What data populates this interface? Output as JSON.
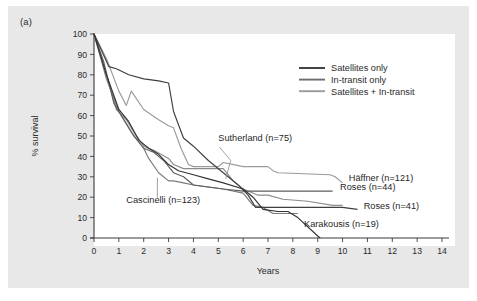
{
  "figure": {
    "panel_label": "(a)",
    "background_color": "#e8e8e8",
    "plot_background_color": "#ffffff"
  },
  "chart_data": {
    "type": "line",
    "title": "",
    "xlabel": "Years",
    "ylabel": "% survival",
    "xlim": [
      0,
      14
    ],
    "ylim": [
      0,
      100
    ],
    "xticks": [
      0,
      1,
      2,
      3,
      4,
      5,
      6,
      7,
      8,
      9,
      10,
      11,
      12,
      13,
      14
    ],
    "yticks": [
      0,
      10,
      20,
      30,
      40,
      50,
      60,
      70,
      80,
      90,
      100
    ],
    "grid": false,
    "legend_position": "upper-right",
    "legend": [
      {
        "label": "Satellites only",
        "color": "#3a3a3a"
      },
      {
        "label": "In-transit only",
        "color": "#6e6e6e"
      },
      {
        "label": "Satellites + In-transit",
        "color": "#9a9a9a"
      }
    ],
    "series": [
      {
        "name": "Haffner (n=121)",
        "group": "Satellites + In-transit",
        "color": "#9a9a9a",
        "points": [
          [
            0,
            100
          ],
          [
            0.5,
            88
          ],
          [
            1.0,
            72
          ],
          [
            1.3,
            65
          ],
          [
            1.5,
            72
          ],
          [
            2.0,
            63
          ],
          [
            2.6,
            58
          ],
          [
            3.0,
            55
          ],
          [
            3.2,
            54
          ],
          [
            3.5,
            44
          ],
          [
            3.8,
            36
          ],
          [
            4.0,
            35
          ],
          [
            5.0,
            35
          ],
          [
            5.2,
            37
          ],
          [
            6.0,
            35
          ],
          [
            7.0,
            35
          ],
          [
            7.2,
            33
          ],
          [
            7.4,
            32
          ],
          [
            9.5,
            31
          ],
          [
            9.7,
            30
          ],
          [
            10.0,
            27
          ]
        ]
      },
      {
        "name": "Sutherland (n=75)",
        "group": "Satellites + In-transit",
        "color": "#8c8c8c",
        "points": [
          [
            0,
            100
          ],
          [
            0.4,
            84
          ],
          [
            0.9,
            63
          ],
          [
            1.3,
            58
          ],
          [
            1.6,
            52
          ],
          [
            2.0,
            45
          ],
          [
            2.4,
            43
          ],
          [
            3.0,
            39
          ],
          [
            3.2,
            36
          ],
          [
            3.6,
            34
          ],
          [
            4.0,
            34
          ],
          [
            4.6,
            34
          ],
          [
            5.2,
            34
          ],
          [
            5.6,
            28
          ],
          [
            6.0,
            24
          ],
          [
            6.6,
            21
          ],
          [
            7.0,
            21
          ],
          [
            7.6,
            19
          ],
          [
            8.6,
            18
          ],
          [
            9.6,
            16
          ],
          [
            10.0,
            16
          ]
        ]
      },
      {
        "name": "Cascinelli (n=123)",
        "group": "In-transit only",
        "color": "#7a7a7a",
        "points": [
          [
            0,
            100
          ],
          [
            0.5,
            78
          ],
          [
            1.0,
            62
          ],
          [
            1.5,
            52
          ],
          [
            2.0,
            44
          ],
          [
            2.2,
            39
          ],
          [
            2.6,
            32
          ],
          [
            3.0,
            28
          ],
          [
            3.2,
            28
          ],
          [
            3.6,
            27
          ],
          [
            4.0,
            26
          ],
          [
            4.6,
            25
          ],
          [
            5.2,
            24
          ],
          [
            6.0,
            22
          ],
          [
            6.4,
            16
          ],
          [
            6.8,
            15
          ],
          [
            7.2,
            12
          ],
          [
            8.0,
            12
          ],
          [
            8.2,
            12
          ]
        ]
      },
      {
        "name": "Roses (n=44)",
        "group": "In-transit only",
        "color": "#5e5e5e",
        "points": [
          [
            0,
            100
          ],
          [
            0.4,
            86
          ],
          [
            0.8,
            66
          ],
          [
            1.2,
            58
          ],
          [
            1.6,
            50
          ],
          [
            2.0,
            44
          ],
          [
            2.4,
            42
          ],
          [
            2.8,
            38
          ],
          [
            3.2,
            32
          ],
          [
            3.6,
            30
          ],
          [
            4.0,
            26
          ],
          [
            4.6,
            25
          ],
          [
            5.2,
            24
          ],
          [
            6.0,
            23
          ],
          [
            6.6,
            23
          ],
          [
            7.4,
            23
          ],
          [
            8.2,
            23
          ],
          [
            9.0,
            23
          ],
          [
            9.6,
            23
          ]
        ]
      },
      {
        "name": "Roses (n=41)",
        "group": "Satellites only",
        "color": "#3f3f3f",
        "points": [
          [
            0,
            100
          ],
          [
            0.6,
            84
          ],
          [
            0.9,
            83
          ],
          [
            1.4,
            80
          ],
          [
            2.0,
            78
          ],
          [
            2.6,
            77
          ],
          [
            3.0,
            76
          ],
          [
            3.2,
            62
          ],
          [
            3.6,
            49
          ],
          [
            4.0,
            45
          ],
          [
            4.6,
            38
          ],
          [
            5.2,
            32
          ],
          [
            5.8,
            26
          ],
          [
            6.2,
            21
          ],
          [
            6.5,
            15
          ],
          [
            7.0,
            15
          ],
          [
            8.0,
            15
          ],
          [
            9.0,
            15
          ],
          [
            10.0,
            15
          ],
          [
            10.6,
            14
          ]
        ]
      },
      {
        "name": "Karakousis (n=19)",
        "group": "Satellites only",
        "color": "#333333",
        "points": [
          [
            0,
            100
          ],
          [
            0.5,
            80
          ],
          [
            1.0,
            63
          ],
          [
            1.4,
            57
          ],
          [
            1.8,
            48
          ],
          [
            2.2,
            44
          ],
          [
            2.6,
            41
          ],
          [
            3.0,
            36
          ],
          [
            3.4,
            33
          ],
          [
            4.0,
            31
          ],
          [
            4.6,
            29
          ],
          [
            5.2,
            27
          ],
          [
            6.0,
            24
          ],
          [
            6.4,
            20
          ],
          [
            6.8,
            14
          ],
          [
            7.4,
            13
          ],
          [
            7.8,
            13
          ],
          [
            8.2,
            10
          ],
          [
            9.0,
            1
          ],
          [
            9.1,
            0
          ]
        ]
      }
    ],
    "annotations": [
      {
        "text": "Sutherland (n=75)",
        "anchor": "start",
        "label_x": 5.0,
        "label_y": 47.5,
        "leader": [
          [
            5.05,
            44.5
          ],
          [
            5.5,
            38.0
          ],
          [
            5.3,
            29.0
          ]
        ]
      },
      {
        "text": "Häffner (n=121)",
        "anchor": "start",
        "label_x": 10.25,
        "label_y": 28.0,
        "leader": []
      },
      {
        "text": "Roses (n=44)",
        "anchor": "start",
        "label_x": 9.9,
        "label_y": 23.5,
        "leader": []
      },
      {
        "text": "Cascinelli (n=123)",
        "anchor": "start",
        "label_x": 1.3,
        "label_y": 17.0,
        "leader": [
          [
            2.55,
            19.8
          ],
          [
            2.55,
            29.5
          ]
        ]
      },
      {
        "text": "Roses (n=41)",
        "anchor": "start",
        "label_x": 10.85,
        "label_y": 14.0,
        "leader": []
      },
      {
        "text": "Karakousis (n=19)",
        "anchor": "start",
        "label_x": 8.45,
        "label_y": 5.5,
        "leader": []
      }
    ]
  }
}
